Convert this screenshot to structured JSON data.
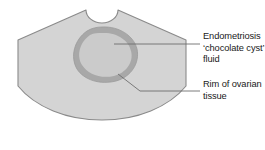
{
  "figure": {
    "type": "ultrasound-sector-scan-diagram"
  },
  "colors": {
    "scan_fill": "#d4d4d4",
    "scan_outline": "#8a8a8a",
    "cyst_rim": "#a6a6a6",
    "cyst_fill": "#cfcfcf",
    "leader_line": "#6e6e6e",
    "text": "#1a1a1a",
    "background": "#ffffff"
  },
  "shapes": {
    "scan_sector": {
      "name": "ultrasound-sector",
      "notch": "semicircular transducer notch at top centre"
    },
    "cyst": {
      "name": "chocolate-cyst",
      "rim_thickness_px": 6
    }
  },
  "labels": [
    {
      "id": "cyst",
      "name": "Endometriosis chocolate cyst fluid",
      "lines": [
        "Endometriosis",
        "‘chocolate cyst’",
        "fluid"
      ]
    },
    {
      "id": "rim",
      "name": "Rim of ovarian tissue",
      "lines": [
        "Rim of ovarian",
        "tissue"
      ]
    }
  ],
  "leaders": {
    "cyst_leader": "horizontal line from inside cyst to text",
    "rim_leader": "diagonal from lower-right rim then horizontal to text"
  }
}
